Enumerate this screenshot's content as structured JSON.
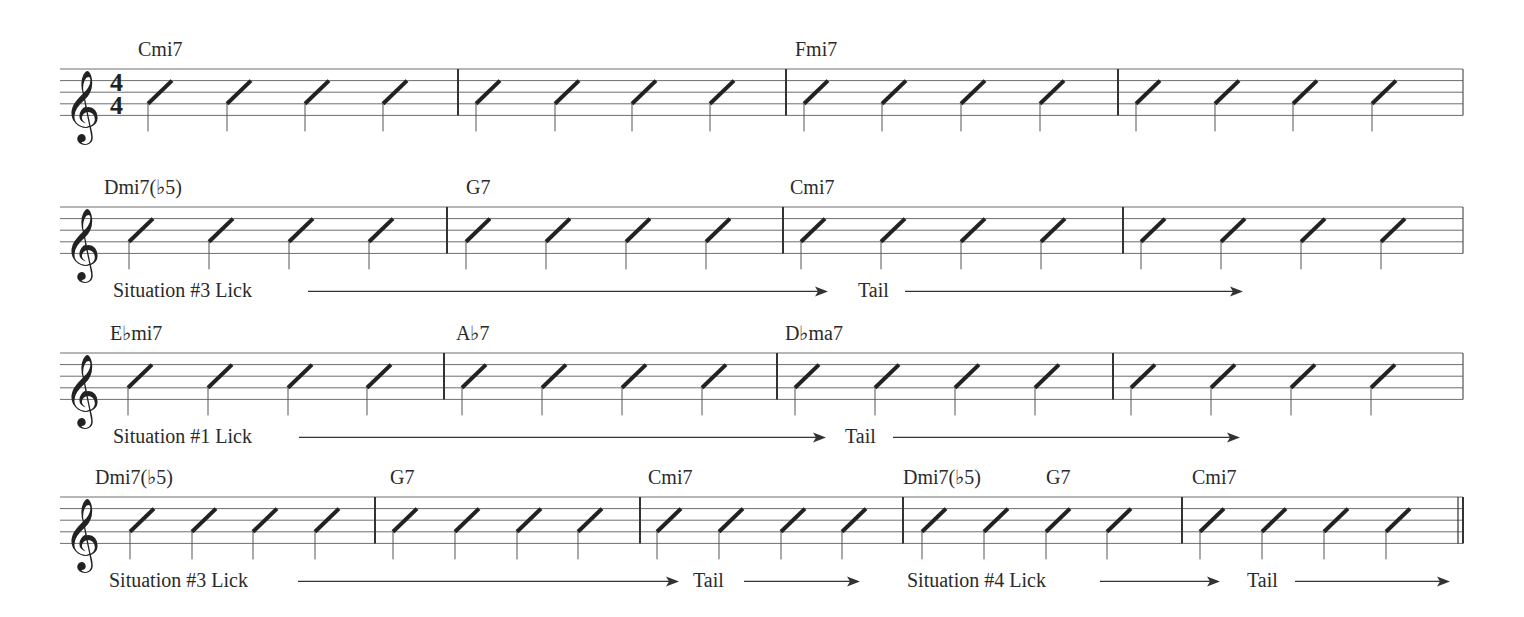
{
  "document": {
    "clef": "treble",
    "time_signature": {
      "top": "4",
      "bottom": "4"
    },
    "staff_left": 60,
    "staff_right": 1463,
    "line_spacing": 11.6,
    "systems": [
      {
        "staff_top": 69,
        "show_time_signature": true,
        "barlines": [
          458,
          786,
          1118
        ],
        "end_barline": "single",
        "slash_stems": [
          148,
          227,
          305,
          383,
          476,
          555,
          632,
          710,
          804,
          882,
          961,
          1040,
          1136,
          1215,
          1293,
          1372
        ],
        "chords": [
          {
            "label": "Cmi7",
            "x": 138
          },
          {
            "label": "Fmi7",
            "x": 795
          }
        ],
        "annotations": []
      },
      {
        "staff_top": 207,
        "show_time_signature": false,
        "barlines": [
          447,
          783,
          1123
        ],
        "end_barline": "single",
        "slash_stems": [
          129,
          209,
          289,
          369,
          466,
          546,
          626,
          706,
          801,
          881,
          961,
          1041,
          1141,
          1221,
          1301,
          1381
        ],
        "chords": [
          {
            "label": "Dmi7(♭5)",
            "x": 104
          },
          {
            "label": "G7",
            "x": 466
          },
          {
            "label": "Cmi7",
            "x": 790
          }
        ],
        "annotations": [
          {
            "label": "Situation #3 Lick",
            "text_x": 113,
            "line_from": 308,
            "line_to": 828
          },
          {
            "label": "Tail",
            "text_x": 858,
            "line_from": 905,
            "line_to": 1243
          }
        ]
      },
      {
        "staff_top": 353,
        "show_time_signature": false,
        "barlines": [
          444,
          777,
          1113
        ],
        "end_barline": "single",
        "slash_stems": [
          128,
          208,
          288,
          367,
          462,
          542,
          622,
          702,
          795,
          875,
          955,
          1035,
          1131,
          1211,
          1291,
          1371
        ],
        "chords": [
          {
            "label": "E♭mi7",
            "x": 110
          },
          {
            "label": "A♭7",
            "x": 456
          },
          {
            "label": "D♭ma7",
            "x": 785
          }
        ],
        "annotations": [
          {
            "label": "Situation #1 Lick",
            "text_x": 113,
            "line_from": 299,
            "line_to": 826
          },
          {
            "label": "Tail",
            "text_x": 845,
            "line_from": 893,
            "line_to": 1240
          }
        ]
      },
      {
        "staff_top": 497,
        "show_time_signature": false,
        "barlines": [
          375,
          640,
          903,
          1182
        ],
        "end_barline": "final",
        "slash_stems": [
          130,
          192,
          253,
          315,
          393,
          455,
          517,
          578,
          657,
          719,
          781,
          842,
          922,
          984,
          1046,
          1107,
          1200,
          1262,
          1324,
          1386
        ],
        "chords": [
          {
            "label": "Dmi7(♭5)",
            "x": 95
          },
          {
            "label": "G7",
            "x": 390
          },
          {
            "label": "Cmi7",
            "x": 648
          },
          {
            "label": "Dmi7(♭5)",
            "x": 903
          },
          {
            "label": "G7",
            "x": 1046
          },
          {
            "label": "Cmi7",
            "x": 1192
          }
        ],
        "annotations": [
          {
            "label": "Situation #3 Lick",
            "text_x": 109,
            "line_from": 298,
            "line_to": 679
          },
          {
            "label": "Tail",
            "text_x": 693,
            "line_from": 744,
            "line_to": 860
          },
          {
            "label": "Situation #4 Lick",
            "text_x": 907,
            "line_from": 1100,
            "line_to": 1220
          },
          {
            "label": "Tail",
            "text_x": 1247,
            "line_from": 1295,
            "line_to": 1450
          }
        ]
      }
    ]
  }
}
